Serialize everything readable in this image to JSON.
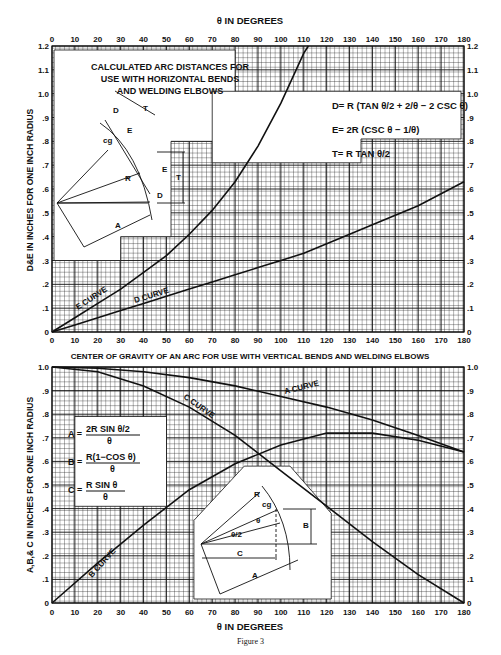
{
  "page": {
    "figure_caption": "Figure 3",
    "header_fragment": "255"
  },
  "chart_data": [
    {
      "type": "line",
      "title": "CALCULATED ARC DISTANCES FOR USE WITH HORIZONTAL BENDS AND WELDING ELBOWS",
      "xlabel": "θ IN DEGREES",
      "ylabel": "D&E IN INCHES FOR ONE INCH RADIUS",
      "xlim": [
        0,
        180
      ],
      "ylim": [
        0,
        1.2
      ],
      "x_ticks": [
        "0",
        "10",
        "20",
        "30",
        "40",
        "50",
        "60",
        "70",
        "80",
        "90",
        "100",
        "110",
        "120",
        "130",
        "140",
        "150",
        "160",
        "170",
        "180"
      ],
      "y_ticks_left": [
        "0",
        ".1",
        ".2",
        ".3",
        ".4",
        ".5",
        ".6",
        ".7",
        ".8",
        ".9",
        "1.0",
        "1.1",
        "1.2"
      ],
      "y_ticks_right": [
        "0",
        ".1",
        ".2",
        ".3",
        ".4",
        ".5",
        ".6",
        ".7",
        ".8",
        ".9",
        "1.0",
        "1.1",
        "1.2"
      ],
      "grid": true,
      "formulas": [
        "D = R (TAN θ/2 + 2/θ − 2 CSC θ)",
        "E = 2R (CSC θ − 1/θ)",
        "T = R TAN θ/2"
      ],
      "series": [
        {
          "name": "E CURVE",
          "x": [
            0,
            10,
            20,
            30,
            40,
            50,
            60,
            70,
            80,
            90,
            100,
            110,
            112
          ],
          "y": [
            0,
            0.06,
            0.12,
            0.18,
            0.25,
            0.32,
            0.41,
            0.51,
            0.63,
            0.78,
            0.96,
            1.17,
            1.2
          ]
        },
        {
          "name": "D CURVE",
          "x": [
            0,
            10,
            20,
            30,
            40,
            50,
            60,
            70,
            80,
            90,
            100,
            110,
            120,
            130,
            140,
            150,
            160,
            170,
            180
          ],
          "y": [
            0,
            0.03,
            0.06,
            0.09,
            0.12,
            0.15,
            0.18,
            0.21,
            0.24,
            0.27,
            0.3,
            0.33,
            0.37,
            0.41,
            0.45,
            0.49,
            0.53,
            0.58,
            0.63
          ]
        }
      ],
      "diagram_labels": [
        "T",
        "D",
        "E",
        "cg",
        "θ",
        "R",
        "θ/2",
        "A",
        "E",
        "T",
        "D"
      ]
    },
    {
      "type": "line",
      "title": "CENTER OF GRAVITY OF AN ARC FOR USE WITH VERTICAL BENDS AND WELDING ELBOWS",
      "xlabel": "θ IN DEGREES",
      "ylabel": "A,B,& C IN INCHES FOR ONE INCH RADIUS",
      "xlim": [
        0,
        180
      ],
      "ylim": [
        0,
        1.0
      ],
      "x_ticks": [
        "0",
        "10",
        "20",
        "30",
        "40",
        "50",
        "60",
        "70",
        "80",
        "90",
        "100",
        "110",
        "120",
        "130",
        "140",
        "150",
        "160",
        "170",
        "180"
      ],
      "y_ticks_left": [
        "0",
        ".1",
        ".2",
        ".3",
        ".4",
        ".5",
        ".6",
        ".7",
        ".8",
        ".9",
        "1.0"
      ],
      "y_ticks_right": [
        "0",
        ".1",
        ".2",
        ".3",
        ".4",
        ".5",
        ".6",
        ".7",
        ".8",
        ".9",
        "1.0"
      ],
      "grid": true,
      "formulas": [
        "A = 2R SIN(θ/2) / θ",
        "B = R(1−COS θ) / θ",
        "C = R SIN θ / θ"
      ],
      "series": [
        {
          "name": "A CURVE",
          "x": [
            0,
            20,
            40,
            60,
            80,
            100,
            120,
            140,
            160,
            180
          ],
          "y": [
            1.0,
            0.995,
            0.98,
            0.955,
            0.92,
            0.875,
            0.83,
            0.775,
            0.71,
            0.64
          ]
        },
        {
          "name": "B CURVE",
          "x": [
            0,
            20,
            40,
            60,
            80,
            100,
            120,
            140,
            160,
            180
          ],
          "y": [
            0,
            0.17,
            0.33,
            0.48,
            0.59,
            0.67,
            0.72,
            0.72,
            0.69,
            0.64
          ]
        },
        {
          "name": "C CURVE",
          "x": [
            0,
            20,
            40,
            60,
            80,
            100,
            120,
            140,
            160,
            180
          ],
          "y": [
            1.0,
            0.98,
            0.92,
            0.83,
            0.71,
            0.56,
            0.41,
            0.26,
            0.12,
            0
          ]
        }
      ],
      "diagram_labels": [
        "R",
        "cg",
        "θ",
        "θ/2",
        "B",
        "C",
        "A"
      ]
    }
  ],
  "labels": {
    "top_axis_title": "θ IN DEGREES",
    "bottom_axis_title": "θ IN DEGREES",
    "mid_title": "CENTER OF GRAVITY OF AN ARC FOR USE WITH VERTICAL BENDS AND WELDING ELBOWS",
    "box1_lines": [
      "CALCULATED ARC DISTANCES FOR",
      "USE WITH HORIZONTAL BENDS",
      "AND WELDING ELBOWS"
    ],
    "formula_D": "D= R (TAN θ/2 + 2/θ − 2 CSC θ)",
    "formula_E": "E= 2R (CSC θ − 1/θ)",
    "formula_T": "T= R TAN θ/2",
    "formula_A": "A= 2R SIN θ/2 / θ",
    "formula_B": "B= R(1−COS θ) / θ",
    "formula_C": "C= R SIN θ / θ",
    "e_curve": "E CURVE",
    "d_curve": "D CURVE",
    "a_curve": "A CURVE",
    "b_curve": "B CURVE",
    "c_curve": "C CURVE",
    "ylabel_top": "D&E IN INCHES FOR ONE INCH RADIUS",
    "ylabel_bottom": "A,B,& C IN INCHES FOR ONE INCH RADIUS"
  }
}
